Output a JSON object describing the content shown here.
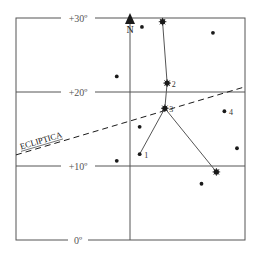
{
  "diagram": {
    "type": "star-chart",
    "colors": {
      "ink": "#1a1a1a",
      "grid": "#555555",
      "paper": "#ffffff"
    },
    "gridlines": [
      {
        "label": "+30º",
        "dec": 30
      },
      {
        "label": "+20º",
        "dec": 20
      },
      {
        "label": "+10º",
        "dec": 10
      },
      {
        "label": "0º",
        "dec": 0
      }
    ],
    "north_label": "N",
    "ecliptic_label": "ECLIPTICA",
    "ecliptic": {
      "start_dec": 11.5,
      "end_dec": 20.7
    },
    "stars": [
      {
        "id": "a",
        "ra": 0.55,
        "dec": 28.8,
        "mag": "small",
        "label": ""
      },
      {
        "id": "b",
        "ra": 0.64,
        "dec": 29.5,
        "mag": "large",
        "label": ""
      },
      {
        "id": "c",
        "ra": 0.86,
        "dec": 28.0,
        "mag": "small",
        "label": ""
      },
      {
        "id": "d",
        "ra": 0.44,
        "dec": 22.1,
        "mag": "small",
        "label": ""
      },
      {
        "id": "s2",
        "ra": 0.66,
        "dec": 21.2,
        "mag": "large",
        "label": "2"
      },
      {
        "id": "s3",
        "ra": 0.65,
        "dec": 17.8,
        "mag": "large",
        "label": "3"
      },
      {
        "id": "s4",
        "ra": 0.91,
        "dec": 17.4,
        "mag": "small",
        "label": "4"
      },
      {
        "id": "e",
        "ra": 0.54,
        "dec": 15.3,
        "mag": "small",
        "label": ""
      },
      {
        "id": "s1",
        "ra": 0.54,
        "dec": 11.6,
        "mag": "small",
        "label": "1"
      },
      {
        "id": "f",
        "ra": 0.965,
        "dec": 12.4,
        "mag": "small",
        "label": ""
      },
      {
        "id": "g",
        "ra": 0.44,
        "dec": 10.7,
        "mag": "small",
        "label": ""
      },
      {
        "id": "h",
        "ra": 0.875,
        "dec": 9.2,
        "mag": "large",
        "label": ""
      },
      {
        "id": "i",
        "ra": 0.81,
        "dec": 7.6,
        "mag": "small",
        "label": ""
      }
    ],
    "constellation_lines": [
      [
        "b",
        "s2"
      ],
      [
        "s2",
        "s3"
      ],
      [
        "s3",
        "s1"
      ],
      [
        "s3",
        "h"
      ]
    ]
  }
}
